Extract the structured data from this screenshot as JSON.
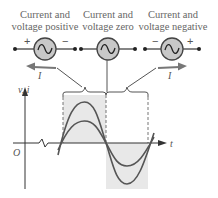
{
  "labels": [
    {
      "line1": "Current and",
      "line2": "voltage positive",
      "cx": 45
    },
    {
      "line1": "Current and",
      "line2": "voltage zero",
      "cx": 108
    },
    {
      "line1": "Current and",
      "line2": "voltage negative",
      "cx": 172
    }
  ],
  "sources": [
    {
      "left_sign": "+",
      "right_sign": "−",
      "current_label": "I",
      "arrow_direction": "left"
    },
    {
      "left_sign": "",
      "right_sign": "",
      "current_label": "",
      "arrow_direction": "none"
    },
    {
      "left_sign": "−",
      "right_sign": "+",
      "current_label": "I",
      "arrow_direction": "right"
    }
  ],
  "axes": {
    "y_label": "v, i",
    "x_label": "t",
    "origin_label": "O"
  },
  "colors": {
    "source_fill": "#c8c8c8",
    "stroke": "#444444",
    "curve": "#555555",
    "shade": "#e6e6e6",
    "text": "#555555"
  }
}
